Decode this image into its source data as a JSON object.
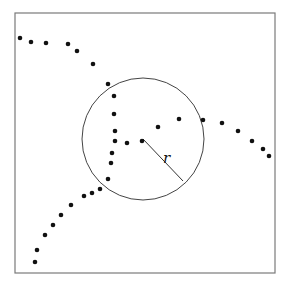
{
  "figure": {
    "width": 290,
    "height": 284,
    "frame": {
      "x": 15,
      "y": 13,
      "width": 260,
      "height": 260,
      "stroke": "#7a7a7a"
    },
    "circle": {
      "cx": 143,
      "cy": 139,
      "r": 61,
      "stroke": "#444444"
    },
    "radius": {
      "x1": 143,
      "y1": 139,
      "x2": 183,
      "y2": 181,
      "label": "r",
      "label_x": 163,
      "label_y": 163
    },
    "dot_radius": 2.3,
    "dot_color": "#111111",
    "dots": [
      {
        "x": 20,
        "y": 38
      },
      {
        "x": 31,
        "y": 42
      },
      {
        "x": 46,
        "y": 43
      },
      {
        "x": 68,
        "y": 44
      },
      {
        "x": 77,
        "y": 51
      },
      {
        "x": 93,
        "y": 64
      },
      {
        "x": 108,
        "y": 84
      },
      {
        "x": 114,
        "y": 96
      },
      {
        "x": 114,
        "y": 114
      },
      {
        "x": 115,
        "y": 131
      },
      {
        "x": 115,
        "y": 141
      },
      {
        "x": 127,
        "y": 143
      },
      {
        "x": 142,
        "y": 141
      },
      {
        "x": 158,
        "y": 127
      },
      {
        "x": 179,
        "y": 119
      },
      {
        "x": 203,
        "y": 120
      },
      {
        "x": 222,
        "y": 123
      },
      {
        "x": 238,
        "y": 131
      },
      {
        "x": 252,
        "y": 141
      },
      {
        "x": 263,
        "y": 149
      },
      {
        "x": 269,
        "y": 156
      },
      {
        "x": 112,
        "y": 153
      },
      {
        "x": 111,
        "y": 163
      },
      {
        "x": 108,
        "y": 179
      },
      {
        "x": 100,
        "y": 189
      },
      {
        "x": 92,
        "y": 193
      },
      {
        "x": 84,
        "y": 196
      },
      {
        "x": 71,
        "y": 205
      },
      {
        "x": 61,
        "y": 215
      },
      {
        "x": 53,
        "y": 225
      },
      {
        "x": 45,
        "y": 235
      },
      {
        "x": 37,
        "y": 250
      },
      {
        "x": 35,
        "y": 262
      }
    ]
  }
}
